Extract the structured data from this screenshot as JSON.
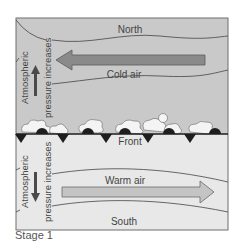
{
  "diagram": {
    "labels": {
      "north": "North",
      "south": "South",
      "cold_air": "Cold air",
      "warm_air": "Warm air",
      "front": "Front",
      "pressure_line1": "Atmospheric",
      "pressure_line2": "pressure increases"
    },
    "caption": "Stage 1",
    "colors": {
      "cold_region": "#c9c9c9",
      "warm_region": "#e8e8e8",
      "cold_arrow": "#8a8a8a",
      "warm_arrow": "#c4c4c4",
      "pressure_arrow": "#4a4a4a",
      "front_line": "#1e1e1e",
      "frame": "#6e6e6e",
      "text": "#444444"
    }
  }
}
